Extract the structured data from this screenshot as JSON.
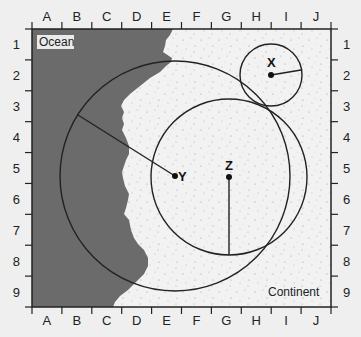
{
  "map": {
    "columns": [
      "A",
      "B",
      "C",
      "D",
      "E",
      "F",
      "G",
      "H",
      "I",
      "J"
    ],
    "rows": [
      "1",
      "2",
      "3",
      "4",
      "5",
      "6",
      "7",
      "8",
      "9"
    ],
    "regions": {
      "ocean": {
        "label": "Ocean",
        "color": "#6b6b6b"
      },
      "continent": {
        "label": "Continent",
        "color": "#f2f2f2"
      }
    },
    "stations": [
      {
        "label": "X",
        "grid": "H-2",
        "radius_cells": 1.0
      },
      {
        "label": "Y",
        "grid": "E-5",
        "radius_cells": 3.8
      },
      {
        "label": "Z",
        "grid": "G-5",
        "radius_cells": 2.6
      }
    ],
    "colors": {
      "frame": "#222222",
      "circle": "#222222",
      "background": "#efefef"
    }
  }
}
